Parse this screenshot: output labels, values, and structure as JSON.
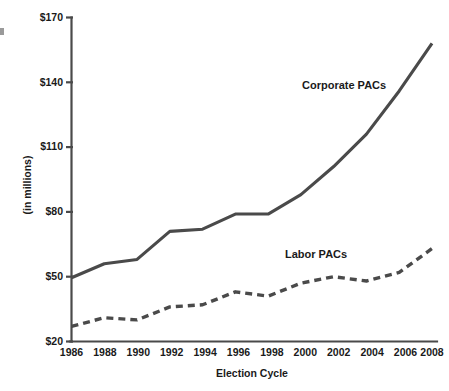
{
  "chart_data": {
    "type": "line",
    "title": "",
    "subtitle": "",
    "xlabel": "Election Cycle",
    "ylabel": "(in millions)",
    "categories": [
      "1986",
      "1988",
      "1990",
      "1992",
      "1994",
      "1996",
      "1998",
      "2000",
      "2002",
      "2004",
      "2006",
      "2008"
    ],
    "x": [
      1986,
      1988,
      1990,
      1992,
      1994,
      1996,
      1998,
      2000,
      2002,
      2004,
      2006,
      2008
    ],
    "series": [
      {
        "name": "Corporate PACs",
        "style": "solid",
        "color": "#4a4a4a",
        "values": [
          49.5,
          56,
          58,
          71,
          72,
          79,
          79,
          88,
          101,
          116,
          136,
          158
        ]
      },
      {
        "name": "Labor PACs",
        "style": "dashed",
        "color": "#4a4a4a",
        "values": [
          27,
          31,
          30,
          36,
          37,
          43,
          41,
          47,
          50,
          48,
          52,
          63
        ]
      }
    ],
    "ylim": [
      20,
      170
    ],
    "yticks": [
      20,
      50,
      80,
      110,
      140,
      170
    ],
    "ytick_labels": [
      "$20",
      "$50",
      "$80",
      "$110",
      "$140",
      "$170"
    ],
    "xlim": [
      1986,
      2008
    ],
    "grid": false,
    "legend": "inline-annotations",
    "annotations": [
      {
        "text": "Corporate PACs",
        "x": 2002.1,
        "y": 131
      },
      {
        "text": "Labor PACs",
        "x": 2000.0,
        "y": 66
      }
    ]
  },
  "axes": {
    "y_axis_title": "(in millions)",
    "x_axis_title": "Election Cycle",
    "y_tick_labels": [
      "$170",
      "$140",
      "$110",
      "$80",
      "$50",
      "$20"
    ],
    "x_tick_labels": [
      "1986",
      "1988",
      "1990",
      "1992",
      "1994",
      "1996",
      "1998",
      "2000",
      "2002",
      "2004",
      "2006",
      "2008"
    ]
  },
  "series_labels": {
    "corporate": "Corporate PACs",
    "labor": "Labor PACs"
  },
  "colors": {
    "line": "#4a4a4a",
    "text": "#1a1a1a",
    "background": "#ffffff"
  }
}
